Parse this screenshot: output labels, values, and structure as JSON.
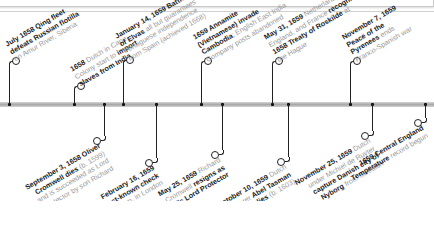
{
  "timeline": {
    "axis_color": "#b0b0b0",
    "line_color": "#222222",
    "text_bold_color": "#1a1a1a",
    "text_light_color": "#9a9a9a",
    "events_above": [
      {
        "lines": [
          {
            "b": "July 1658 Qing fleet"
          },
          {
            "b": "defeats Russian flotilla"
          },
          {
            "t": "on Amur River, Siberia"
          }
        ]
      },
      {
        "lines": [
          {
            "b": "1658",
            "t": " Dutch in Cape"
          },
          {
            "t": "Colony start to ",
            "b2": "import"
          },
          {
            "b": "slaves from India"
          }
        ]
      },
      {
        "lines": [
          {
            "b": "January 14, 1659 Battle"
          },
          {
            "b": "of Elvas",
            "t": " all but guarantees"
          },
          {
            "t": "Portuguese independence"
          },
          {
            "t": "from Spain (achieved 1668)"
          }
        ]
      },
      {
        "lines": [
          {
            "b": "1659 Annamite"
          },
          {
            "b": "(Vietnamese) invade"
          },
          {
            "b": "Cambodia",
            "t": "; English East India"
          },
          {
            "t": "Company posts abandoned"
          }
        ]
      },
      {
        "lines": [
          {
            "b": "May 31, 1659",
            "t": " Netherlands,"
          },
          {
            "t": "England, and France ",
            "b2": "recognize"
          },
          {
            "b": "1658 Treaty of Roskilde",
            "t": " at"
          },
          {
            "t": "the Hague"
          }
        ]
      },
      {
        "lines": [
          {
            "b": "November 7, 1659"
          },
          {
            "b": "Peace of the"
          },
          {
            "b": "Pyrenees",
            "t": " ends"
          },
          {
            "t": "Franco-Spanish war"
          }
        ]
      }
    ],
    "events_below": [
      {
        "lines": [
          {
            "b": "September 3, 1658 Oliver"
          },
          {
            "b": "Cromwell dies",
            "t": " (b. 1599)"
          },
          {
            "t": "and is succeeded as Lord"
          },
          {
            "t": "Protector by son Richard"
          }
        ]
      },
      {
        "lines": [
          {
            "b": "February 16, 1659"
          },
          {
            "b": "Earliest-known check"
          },
          {
            "t": "is drawn, in London"
          }
        ]
      },
      {
        "lines": [
          {
            "b": "May 25, 1659",
            "t": " Richard"
          },
          {
            "t": "Cromwell ",
            "b2": "resigns as"
          },
          {
            "b": "England's Lord Protector"
          }
        ]
      },
      {
        "lines": [
          {
            "b": "October 10, 1659",
            "t": " Dutch"
          },
          {
            "t": "explorer ",
            "b2": "Abel Tasman"
          },
          {
            "b": "dies",
            "t": " (b. 1603)"
          }
        ]
      },
      {
        "lines": [
          {
            "b": "November 25, 1659",
            "t": " Dutch"
          },
          {
            "t": "under Michiel de Ruyter"
          },
          {
            "b": "capture Danish city of"
          },
          {
            "b": "Nyborg",
            "t": " from Swedish"
          }
        ]
      },
      {
        "lines": [
          {
            "b": "1659 Central England"
          },
          {
            "b": "Temperature",
            "t": " record begun"
          }
        ]
      }
    ]
  }
}
